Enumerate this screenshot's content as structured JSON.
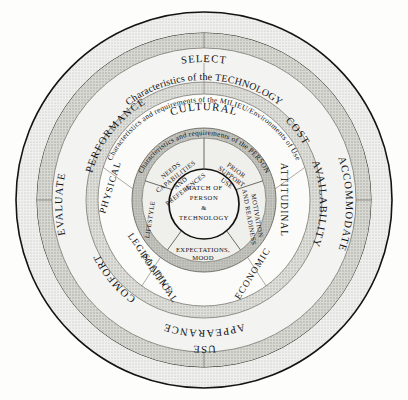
{
  "diagram": {
    "type": "concentric-ring-diagram",
    "colors": {
      "background": "#fdfdfc",
      "outer_ring_fill": "#ededea",
      "technology_band_fill": "#cfcfcb",
      "technology_ring_fill": "#f3f3f1",
      "milieu_band_fill": "#e6e6e3",
      "milieu_ring_fill": "#fbfbfa",
      "person_band_fill": "#c9c9c5",
      "person_ring_fill": "#efefec",
      "core_fill": "#f6f6f4",
      "stroke": "#15130f",
      "divider": "#6d6a63"
    },
    "rings": [
      {
        "name": "outer-process-ring",
        "labels": [
          "SELECT",
          "ACCOMMODATE",
          "USE",
          "EVALUATE"
        ]
      },
      {
        "name": "technology-band",
        "band_label": "Characteristics of the TECHNOLOGY"
      },
      {
        "name": "technology-ring",
        "labels": [
          "PERFORMANCE",
          "COST",
          "ATTITUDINAL",
          "AVAILABILITY",
          "ECONOMIC",
          "APPEARANCE",
          "COMFORT"
        ]
      },
      {
        "name": "milieu-band",
        "band_label": "Characteristics and requirements of the MILIEU/Environments of Use"
      },
      {
        "name": "milieu-ring",
        "labels": [
          "CULTURAL",
          "ATTITUDINAL",
          "ECONOMIC",
          "LEGISLATIVE POLITICAL",
          "PHYSICAL"
        ]
      },
      {
        "name": "person-band",
        "band_label": "Characteristics and requirements of the PERSON"
      },
      {
        "name": "person-ring",
        "labels": [
          "NEEDS CAPABILITIES AND PREFERENCES",
          "PRIOR SUPPORT USE",
          "MOTIVATION AND READINESS",
          "EXPECTATIONS, MOOD",
          "LIFESTYLE"
        ]
      },
      {
        "name": "core",
        "labels": [
          "MATCH OF",
          "PERSON",
          "&",
          "TECHNOLOGY"
        ]
      }
    ],
    "outer_ring": {
      "select": "SELECT",
      "accommodate": "ACCOMMODATE",
      "use": "USE",
      "evaluate": "EVALUATE"
    },
    "technology": {
      "band_label": "Characteristics of the TECHNOLOGY",
      "performance": "PERFORMANCE",
      "cost": "COST",
      "availability": "AVAILABILITY",
      "appearance": "APPEARANCE",
      "comfort": "COMFORT"
    },
    "milieu": {
      "band_label": "Characteristics and requirements of the MILIEU/Environments of Use",
      "cultural": "CULTURAL",
      "attitudinal": "ATTITUDINAL",
      "economic": "ECONOMIC",
      "legislative": "LEGISLATIVE",
      "political": "POLITICAL",
      "physical": "PHYSICAL"
    },
    "person": {
      "band_label": "Characteristics and requirements of the PERSON",
      "needs1": "NEEDS",
      "needs2": "CAPABILITIES",
      "needs3": "AND",
      "needs4": "PREFERENCES",
      "prior1": "PRIOR",
      "prior2": "SUPPORT",
      "prior3": "USE",
      "motivation": "MOTIVATION",
      "readiness": "AND READINESS",
      "expectations1": "EXPECTATIONS,",
      "expectations2": "MOOD",
      "lifestyle": "LIFESTYLE"
    },
    "core": {
      "line1": "MATCH OF",
      "line2": "PERSON",
      "line3": "&",
      "line4": "TECHNOLOGY"
    }
  }
}
